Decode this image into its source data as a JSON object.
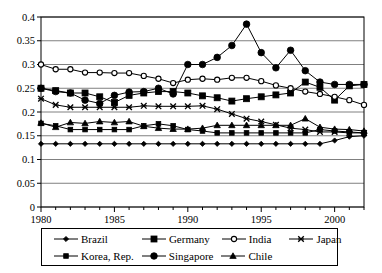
{
  "chart_data": {
    "type": "line",
    "title": "",
    "xlabel": "",
    "ylabel": "",
    "xlim": [
      1980,
      2002
    ],
    "ylim": [
      0,
      0.4
    ],
    "grid": "horizontal",
    "legend_position": "bottom",
    "ytick_labels": [
      "0",
      "0.05",
      "0.1",
      "0.15",
      "0.2",
      "0.25",
      "0.3",
      "0.35",
      "0.4"
    ],
    "ytick_values": [
      0,
      0.05,
      0.1,
      0.15,
      0.2,
      0.25,
      0.3,
      0.35,
      0.4
    ],
    "xtick_labels": [
      "1980",
      "1985",
      "1990",
      "1995",
      "2000"
    ],
    "xtick_values": [
      1980,
      1985,
      1990,
      1995,
      2000
    ],
    "x": [
      1980,
      1981,
      1982,
      1983,
      1984,
      1985,
      1986,
      1987,
      1988,
      1989,
      1990,
      1991,
      1992,
      1993,
      1994,
      1995,
      1996,
      1997,
      1998,
      1999,
      2000,
      2001,
      2002
    ],
    "series": [
      {
        "name": "Brazil",
        "marker": "diamond",
        "values": [
          0.133,
          0.133,
          0.133,
          0.133,
          0.133,
          0.133,
          0.133,
          0.133,
          0.133,
          0.133,
          0.133,
          0.133,
          0.133,
          0.133,
          0.133,
          0.133,
          0.133,
          0.133,
          0.133,
          0.133,
          0.14,
          0.148,
          0.15
        ]
      },
      {
        "name": "Germany",
        "marker": "square",
        "values": [
          0.25,
          0.245,
          0.24,
          0.24,
          0.232,
          0.22,
          0.235,
          0.24,
          0.243,
          0.243,
          0.24,
          0.234,
          0.23,
          0.223,
          0.228,
          0.232,
          0.236,
          0.24,
          0.263,
          0.252,
          0.225,
          0.255,
          0.258
        ]
      },
      {
        "name": "India",
        "marker": "circle-open",
        "values": [
          0.3,
          0.29,
          0.29,
          0.283,
          0.283,
          0.282,
          0.282,
          0.276,
          0.27,
          0.261,
          0.268,
          0.27,
          0.268,
          0.272,
          0.272,
          0.265,
          0.256,
          0.25,
          0.243,
          0.238,
          0.232,
          0.225,
          0.215
        ]
      },
      {
        "name": "Japan",
        "marker": "x",
        "values": [
          0.228,
          0.215,
          0.21,
          0.21,
          0.21,
          0.21,
          0.21,
          0.213,
          0.212,
          0.212,
          0.212,
          0.213,
          0.206,
          0.196,
          0.186,
          0.18,
          0.173,
          0.166,
          0.163,
          0.158,
          0.158,
          0.156,
          0.156
        ]
      },
      {
        "name": "Korea, Rep.",
        "marker": "square-small",
        "values": [
          0.176,
          0.171,
          0.163,
          0.163,
          0.163,
          0.163,
          0.163,
          0.171,
          0.175,
          0.171,
          0.163,
          0.16,
          0.156,
          0.156,
          0.156,
          0.156,
          0.156,
          0.156,
          0.156,
          0.163,
          0.16,
          0.158,
          0.156
        ]
      },
      {
        "name": "Singapore",
        "marker": "circle-filled",
        "values": [
          0.25,
          0.243,
          0.24,
          0.225,
          0.218,
          0.235,
          0.242,
          0.243,
          0.25,
          0.238,
          0.3,
          0.3,
          0.315,
          0.34,
          0.385,
          0.325,
          0.293,
          0.33,
          0.287,
          0.263,
          0.258,
          0.258,
          0.258
        ]
      },
      {
        "name": "Chile",
        "marker": "triangle",
        "values": [
          0.177,
          0.168,
          0.178,
          0.176,
          0.18,
          0.178,
          0.18,
          0.17,
          0.166,
          0.164,
          0.164,
          0.166,
          0.172,
          0.172,
          0.172,
          0.172,
          0.172,
          0.172,
          0.186,
          0.168,
          0.164,
          0.163,
          0.16
        ]
      }
    ]
  },
  "legend": {
    "rows": [
      [
        {
          "label": "Brazil",
          "marker": "diamond"
        },
        {
          "label": "Germany",
          "marker": "square"
        },
        {
          "label": "India",
          "marker": "circle-open"
        },
        {
          "label": "Japan",
          "marker": "x"
        }
      ],
      [
        {
          "label": "Korea, Rep.",
          "marker": "square-small"
        },
        {
          "label": "Singapore",
          "marker": "circle-filled"
        },
        {
          "label": "Chile",
          "marker": "triangle"
        }
      ]
    ]
  },
  "colors": {
    "line": "#000000",
    "grid": "#808080",
    "axis": "#000000",
    "background": "#ffffff"
  }
}
